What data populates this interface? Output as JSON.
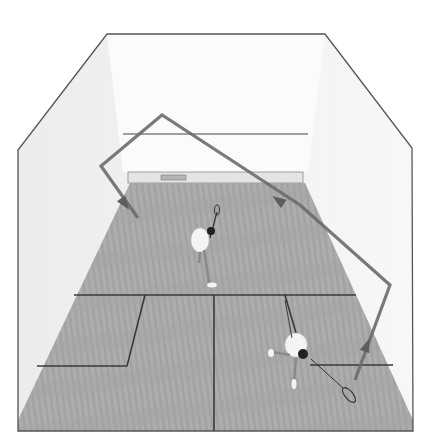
{
  "figure": {
    "description": "Overhead view of a squash court with two players; a ball trajectory is drawn as a line with arrows",
    "colors": {
      "background": "#ffffff",
      "wall": "#f2f2f2",
      "front_wall": "#fafafa",
      "floor": "#a9a9a9",
      "floor_grain": "#9a9a9a",
      "court_lines": "#3a3a3a",
      "outline": "#555555",
      "trajectory": "#6b6b6b",
      "player_shirt": "#f4f4f4",
      "player_hair": "#222222",
      "player_skin": "#8a8a8a"
    }
  },
  "court": {
    "outline_points": "107,34 325,34 412,148 413,431 18,431 18,150",
    "floor_points": "130,183 305,183 413,420 413,431 18,431 18,420",
    "front_wall_points": "107,34 325,34 308,173 123,173",
    "front_wall_line": {
      "x1": 123,
      "y1": 134,
      "x2": 308,
      "y2": 134
    },
    "tin": {
      "x": 128,
      "y": 172,
      "w": 175,
      "h": 11
    },
    "vent": {
      "x": 161,
      "y": 175,
      "w": 25,
      "h": 5
    },
    "short_line": {
      "x1": 74,
      "y1": 295,
      "x2": 356,
      "y2": 295
    },
    "half_court_line": {
      "x1": 214,
      "y1": 295,
      "x2": 214,
      "y2": 431
    },
    "left_box_lines": "145,295 127,366 37,366",
    "right_box_lines": "285,295 298,340 M 310,365 393,365"
  },
  "trajectory": {
    "points": "355,380 390,285 300,205 162,115 101,166 138,218",
    "arrows": [
      {
        "name": "arrow-up-right-wall",
        "x": 367,
        "y": 345,
        "angle": -70
      },
      {
        "name": "arrow-toward-front-wall",
        "x": 278,
        "y": 200,
        "angle": -146
      },
      {
        "name": "arrow-down-to-floor",
        "x": 125,
        "y": 204,
        "angle": 55
      }
    ]
  },
  "players": [
    {
      "name": "back-player",
      "x": 205,
      "y": 250
    },
    {
      "name": "front-player",
      "x": 295,
      "y": 355
    }
  ]
}
